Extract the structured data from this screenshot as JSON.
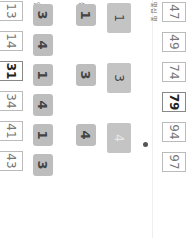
{
  "labels": {
    "result_header": "몇십 몇",
    "tens": "십",
    "ones": "일",
    "bottom_header": "몇십 몇",
    "marker": "❶"
  },
  "big_cards": [
    "1",
    "3",
    "4"
  ],
  "tree": [
    {
      "tens": "1",
      "ones": [
        "3",
        "4"
      ],
      "results": [
        "13",
        "14"
      ]
    },
    {
      "tens": "3",
      "ones": [
        "1",
        "4"
      ],
      "results": [
        "31",
        "34"
      ]
    },
    {
      "tens": "4",
      "ones": [
        "1",
        "3"
      ],
      "results": [
        "41",
        "43"
      ]
    }
  ],
  "bottom_results": [
    "47",
    "49",
    "74",
    "79",
    "94",
    "97"
  ],
  "bold_results": [
    "31",
    "79"
  ]
}
